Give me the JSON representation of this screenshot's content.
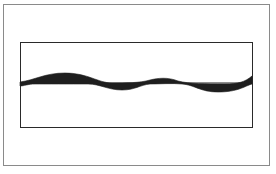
{
  "diagram": {
    "outer_frame": {
      "x": 3,
      "y": 4,
      "width": 267,
      "height": 162
    },
    "inner_box": {
      "x": 20,
      "y": 42,
      "width": 233,
      "height": 86
    },
    "wave_band": {
      "baseline_y": 83,
      "fill_color": "#1e1e1e",
      "upper_curve": "M20,82 C35,80 45,73 65,73 C88,73 98,83 112,83 C125,83 140,83 150,80 C158,78 168,77 178,81 C190,84 205,84 225,84 C238,84 245,82 252,76",
      "lower_curve": "M252,84 C245,86 238,92 218,92 C200,92 195,85 182,84 C172,83 160,84 150,84 C140,85 135,90 122,90 C108,90 100,84 88,84 C70,84 45,84 35,84 C28,84 24,86 20,86 Z"
    }
  }
}
